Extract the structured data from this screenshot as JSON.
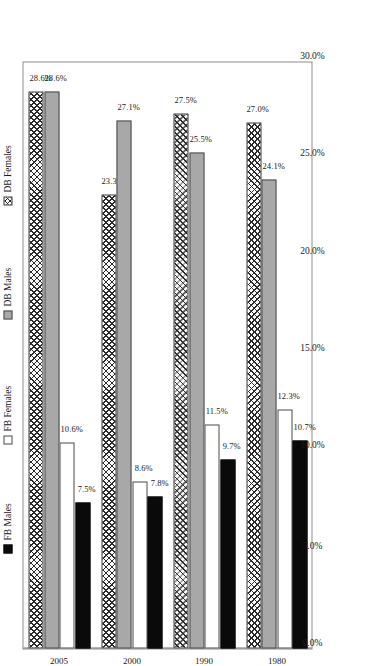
{
  "chart_data": {
    "type": "bar",
    "orientation": "horizontal",
    "title": "",
    "subtitle": "",
    "xlabel": "",
    "ylabel": "",
    "categories": [
      "1980",
      "1990",
      "2000",
      "2005"
    ],
    "series": [
      {
        "name": "FB Males",
        "color": "#0a0a0a",
        "fill": "solid-black",
        "values": [
          10.7,
          9.7,
          7.8,
          7.5
        ],
        "labels": [
          "10.7%",
          "9.7%",
          "7.8%",
          "7.5%"
        ]
      },
      {
        "name": "FB Females",
        "color": "#ffffff",
        "fill": "solid-white",
        "values": [
          12.3,
          11.5,
          8.6,
          10.6
        ],
        "labels": [
          "12.3%",
          "11.5%",
          "8.6%",
          "10.6%"
        ]
      },
      {
        "name": "DB Males",
        "color": "#a8a8a8",
        "fill": "solid-gray",
        "values": [
          24.1,
          25.5,
          27.1,
          28.6
        ],
        "labels": [
          "24.1%",
          "25.5%",
          "27.1%",
          "28.6%"
        ]
      },
      {
        "name": "DB Females",
        "color": "#ffffff",
        "fill": "crosshatch",
        "values": [
          27.0,
          27.5,
          23.3,
          28.6
        ],
        "labels": [
          "27.0%",
          "27.5%",
          "23.3%",
          "28.6%"
        ]
      }
    ],
    "value_axis": {
      "min": 0.0,
      "max": 30.0,
      "ticks": [
        0.0,
        5.0,
        10.0,
        15.0,
        20.0,
        25.0,
        30.0
      ],
      "tick_labels": [
        "0.0%",
        "5.0%",
        "10.0%",
        "15.0%",
        "20.0%",
        "25.0%",
        "30.0%"
      ],
      "direction": "right-to-left"
    },
    "grid": false,
    "legend_position": "right",
    "legend_entries": [
      "FB Males",
      "FB Females",
      "DB Males",
      "DB Females"
    ],
    "rotation": "page rotated 90 degrees counter-clockwise"
  },
  "legend": {
    "items": [
      {
        "label": "FB Males",
        "swatch": "fb-males"
      },
      {
        "label": "FB Females",
        "swatch": "fb-females"
      },
      {
        "label": "DB Males",
        "swatch": "db-males"
      },
      {
        "label": "DB Females",
        "swatch": "db-females"
      }
    ]
  },
  "axis": {
    "tick_labels": [
      "0.0%",
      "5.0%",
      "10.0%",
      "15.0%",
      "20.0%",
      "25.0%",
      "30.0%"
    ]
  }
}
